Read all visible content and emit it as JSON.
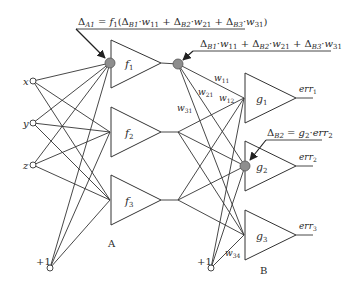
{
  "diagram": {
    "type": "neural-network-backpropagation",
    "inputs": [
      {
        "label": "x"
      },
      {
        "label": "y"
      },
      {
        "label": "z"
      }
    ],
    "bias_a": {
      "label": "+1"
    },
    "bias_b": {
      "label": "+1"
    },
    "layer_a": {
      "label": "A",
      "neurons": [
        {
          "label": "f",
          "sub": "1"
        },
        {
          "label": "f",
          "sub": "2"
        },
        {
          "label": "f",
          "sub": "3"
        }
      ]
    },
    "layer_b": {
      "label": "B",
      "neurons": [
        {
          "label": "g",
          "sub": "1",
          "output": "err",
          "output_sub": "1"
        },
        {
          "label": "g",
          "sub": "2",
          "output": "err",
          "output_sub": "2"
        },
        {
          "label": "g",
          "sub": "3",
          "output": "err",
          "output_sub": "3"
        }
      ]
    },
    "weights": {
      "w11": {
        "base": "w",
        "sub": "11"
      },
      "w21": {
        "base": "w",
        "sub": "21"
      },
      "w12": {
        "base": "w",
        "sub": "12"
      },
      "w31": {
        "base": "w",
        "sub": "31"
      },
      "w34": {
        "base": "w",
        "sub": "34"
      }
    },
    "annotations": {
      "delta_a1": "ΔA1 = f1(ΔB1·w11 + ΔB2·w21 + ΔB3·w31)",
      "sum_b": "ΔB1·w11 + ΔB2·w21 + ΔB3·w31",
      "delta_b2": "ΔB2 = g2·err2"
    },
    "colors": {
      "line": "#333333",
      "highlight_node": "#8e8e8e",
      "background": "#ffffff"
    }
  }
}
